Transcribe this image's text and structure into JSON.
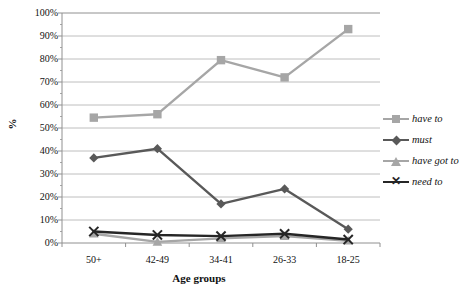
{
  "chart_data": {
    "type": "line",
    "title": "",
    "xlabel": "Age groups",
    "ylabel": "%",
    "ylim": [
      0,
      100
    ],
    "ytick_labels": [
      "0%",
      "10%",
      "20%",
      "30%",
      "40%",
      "50%",
      "60%",
      "70%",
      "80%",
      "90%",
      "100%"
    ],
    "ytick_values": [
      0,
      10,
      20,
      30,
      40,
      50,
      60,
      70,
      80,
      90,
      100
    ],
    "grid": true,
    "legend_position": "right",
    "categories": [
      "50+",
      "42-49",
      "34-41",
      "26-33",
      "18-25"
    ],
    "series": [
      {
        "name": "have to",
        "marker": "square",
        "color": "#a6a6a6",
        "values": [
          54.5,
          56,
          79.5,
          72,
          93
        ]
      },
      {
        "name": "must",
        "marker": "diamond",
        "color": "#595959",
        "values": [
          37,
          41,
          17,
          23.5,
          6
        ]
      },
      {
        "name": "have got to",
        "marker": "triangle",
        "color": "#a6a6a6",
        "values": [
          4,
          0.5,
          2,
          3,
          1
        ]
      },
      {
        "name": "need to",
        "marker": "cross",
        "color": "#262626",
        "values": [
          5,
          3.5,
          3,
          4,
          1.5
        ]
      }
    ]
  },
  "axis": {
    "y_title": "%",
    "x_title": "Age groups"
  },
  "legend": {
    "items": [
      {
        "label": "have to",
        "marker": "square-marker",
        "color": "#a6a6a6"
      },
      {
        "label": "must",
        "marker": "diamond-marker",
        "color": "#595959"
      },
      {
        "label": "have got to",
        "marker": "triangle-marker",
        "color": "#a6a6a6"
      },
      {
        "label": "need to",
        "marker": "cross-marker",
        "color": "#262626"
      }
    ]
  },
  "colors": {
    "grid": "#b7b7b7",
    "axis": "#909090",
    "text": "#111111"
  }
}
